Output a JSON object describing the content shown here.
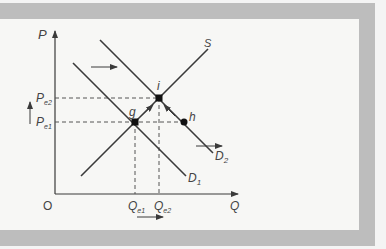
{
  "diagram": {
    "type": "supply-demand-shift",
    "axes": {
      "y_label": "P",
      "x_label": "Q",
      "origin_label": "O"
    },
    "curves": [
      {
        "name": "S",
        "label": "S"
      },
      {
        "name": "D1",
        "label": "D",
        "sub": "1"
      },
      {
        "name": "D2",
        "label": "D",
        "sub": "2"
      }
    ],
    "points": [
      {
        "name": "g",
        "label": "g"
      },
      {
        "name": "i",
        "label": "i"
      },
      {
        "name": "h",
        "label": "h"
      }
    ],
    "price_labels": [
      {
        "label": "P",
        "sub": "e2"
      },
      {
        "label": "P",
        "sub": "e1"
      }
    ],
    "quantity_labels": [
      {
        "label": "Q",
        "sub": "e1"
      },
      {
        "label": "Q",
        "sub": "e2"
      }
    ],
    "colors": {
      "frame": "#bdbdbd",
      "line": "#3a3a3a",
      "background": "#f7f7f5"
    }
  }
}
